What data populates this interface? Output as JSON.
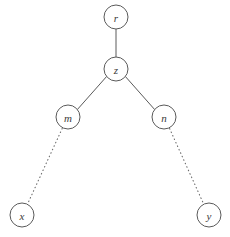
{
  "diagram": {
    "type": "tree-graph",
    "width": 230,
    "height": 237,
    "background_color": "#ffffff",
    "stroke_color": "#5a5a5a",
    "label_color": "#3a3a3a",
    "node_radius": 12,
    "nodes": [
      {
        "id": "r",
        "label": "r",
        "cx": 116,
        "cy": 17
      },
      {
        "id": "z",
        "label": "z",
        "cx": 116,
        "cy": 69
      },
      {
        "id": "m",
        "label": "m",
        "cx": 68,
        "cy": 117
      },
      {
        "id": "n",
        "label": "n",
        "cx": 164,
        "cy": 117
      },
      {
        "id": "x",
        "label": "x",
        "cx": 22,
        "cy": 215
      },
      {
        "id": "y",
        "label": "y",
        "cx": 209,
        "cy": 215
      }
    ],
    "edges": [
      {
        "id": "r-z",
        "from": "r",
        "to": "z",
        "style": "solid",
        "x1": 116,
        "y1": 29,
        "x2": 116,
        "y2": 57
      },
      {
        "id": "z-m",
        "from": "z",
        "to": "m",
        "style": "solid",
        "x1": 106.6,
        "y1": 76.5,
        "x2": 77.4,
        "y2": 109.5
      },
      {
        "id": "z-n",
        "from": "z",
        "to": "n",
        "style": "solid",
        "x1": 125.4,
        "y1": 76.5,
        "x2": 154.6,
        "y2": 109.5
      },
      {
        "id": "m-x",
        "from": "m",
        "to": "x",
        "style": "dotted",
        "x1": 62.2,
        "y1": 128.5,
        "x2": 27.8,
        "y2": 203.5
      },
      {
        "id": "n-y",
        "from": "n",
        "to": "y",
        "style": "dotted",
        "x1": 169.6,
        "y1": 128.6,
        "x2": 203.4,
        "y2": 203.4
      }
    ]
  }
}
